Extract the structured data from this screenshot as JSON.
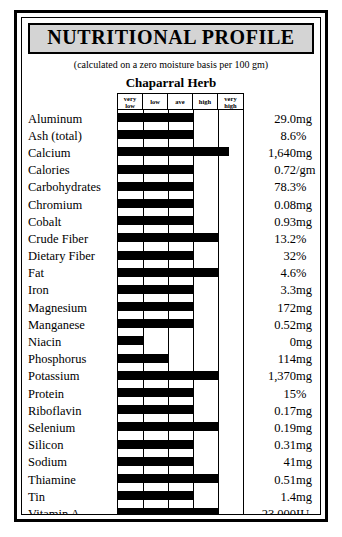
{
  "document": {
    "title": "NUTRITIONAL PROFILE",
    "subtitle": "(calculated on a zero moisture basis per 100 gm)",
    "product": "Chaparral Herb"
  },
  "scale": {
    "labels": [
      {
        "line1": "very",
        "line2": "low"
      },
      {
        "line1": "low",
        "line2": ""
      },
      {
        "line1": "ave",
        "line2": ""
      },
      {
        "line1": "high",
        "line2": ""
      },
      {
        "line1": "very",
        "line2": "high"
      }
    ]
  },
  "colors": {
    "bar": "#000000",
    "title_band": "#d4d4d4",
    "rule": "#000000",
    "page": "#ffffff"
  },
  "rows": [
    {
      "nutrient": "Aluminum",
      "value": "29.0",
      "unit": "mg",
      "bar_pct": 60
    },
    {
      "nutrient": "Ash (total)",
      "value": "8.6",
      "unit": "%",
      "bar_pct": 60
    },
    {
      "nutrient": "Calcium",
      "value": "1,640",
      "unit": "mg",
      "bar_pct": 89
    },
    {
      "nutrient": "Calories",
      "value": "0.72",
      "unit": "/gm",
      "bar_pct": 60
    },
    {
      "nutrient": "Carbohydrates",
      "value": "78.3",
      "unit": "%",
      "bar_pct": 60
    },
    {
      "nutrient": "Chromium",
      "value": "0.08",
      "unit": "mg",
      "bar_pct": 60
    },
    {
      "nutrient": "Cobalt",
      "value": "0.93",
      "unit": "mg",
      "bar_pct": 60
    },
    {
      "nutrient": "Crude Fiber",
      "value": "13.2",
      "unit": "%",
      "bar_pct": 80
    },
    {
      "nutrient": "Dietary Fiber",
      "value": "32",
      "unit": "%",
      "bar_pct": 60
    },
    {
      "nutrient": "Fat",
      "value": "4.6",
      "unit": "%",
      "bar_pct": 80
    },
    {
      "nutrient": "Iron",
      "value": "3.3",
      "unit": "mg",
      "bar_pct": 60
    },
    {
      "nutrient": "Magnesium",
      "value": "172",
      "unit": "mg",
      "bar_pct": 60
    },
    {
      "nutrient": "Manganese",
      "value": "0.52",
      "unit": "mg",
      "bar_pct": 60
    },
    {
      "nutrient": "Niacin",
      "value": "0",
      "unit": "mg",
      "bar_pct": 20
    },
    {
      "nutrient": "Phosphorus",
      "value": "114",
      "unit": "mg",
      "bar_pct": 40
    },
    {
      "nutrient": "Potassium",
      "value": "1,370",
      "unit": "mg",
      "bar_pct": 80
    },
    {
      "nutrient": "Protein",
      "value": "15",
      "unit": "%",
      "bar_pct": 60
    },
    {
      "nutrient": "Riboflavin",
      "value": "0.17",
      "unit": "mg",
      "bar_pct": 60
    },
    {
      "nutrient": "Selenium",
      "value": "0.19",
      "unit": "mg",
      "bar_pct": 80
    },
    {
      "nutrient": "Silicon",
      "value": "0.31",
      "unit": "mg",
      "bar_pct": 60
    },
    {
      "nutrient": "Sodium",
      "value": "41",
      "unit": "mg",
      "bar_pct": 60
    },
    {
      "nutrient": "Thiamine",
      "value": "0.51",
      "unit": "mg",
      "bar_pct": 80
    },
    {
      "nutrient": "Tin",
      "value": "1.4",
      "unit": "mg",
      "bar_pct": 60
    },
    {
      "nutrient": "Vitamin A",
      "value": "23,000",
      "unit": "IU",
      "bar_pct": 80
    },
    {
      "nutrient": "Vitamin C",
      "value": "76",
      "unit": "mg",
      "bar_pct": 80
    },
    {
      "nutrient": "Zinc",
      "value": "trace",
      "unit": "mg",
      "bar_pct": 20
    }
  ],
  "chart_data": {
    "type": "bar",
    "title": "NUTRITIONAL PROFILE",
    "subtitle": "(calculated on a zero moisture basis per 100 gm)",
    "annotations": [
      "Chaparral Herb"
    ],
    "orientation": "horizontal",
    "xlabel": "",
    "ylabel": "",
    "grid": true,
    "legend_position": "none",
    "xtick_labels": [
      "very low",
      "low",
      "ave",
      "high",
      "very high"
    ],
    "xlim": [
      0,
      100
    ],
    "categories": [
      "Aluminum",
      "Ash (total)",
      "Calcium",
      "Calories",
      "Carbohydrates",
      "Chromium",
      "Cobalt",
      "Crude Fiber",
      "Dietary Fiber",
      "Fat",
      "Iron",
      "Magnesium",
      "Manganese",
      "Niacin",
      "Phosphorus",
      "Potassium",
      "Protein",
      "Riboflavin",
      "Selenium",
      "Silicon",
      "Sodium",
      "Thiamine",
      "Tin",
      "Vitamin A",
      "Vitamin C",
      "Zinc"
    ],
    "values": [
      60,
      60,
      89,
      60,
      60,
      60,
      60,
      80,
      60,
      80,
      60,
      60,
      60,
      20,
      40,
      80,
      60,
      60,
      80,
      60,
      60,
      80,
      60,
      80,
      80,
      20
    ],
    "data_labels": [
      "29.0 mg",
      "8.6 %",
      "1,640 mg",
      "0.72 /gm",
      "78.3 %",
      "0.08 mg",
      "0.93 mg",
      "13.2 %",
      "32 %",
      "4.6 %",
      "3.3 mg",
      "172 mg",
      "0.52 mg",
      "0 mg",
      "114 mg",
      "1,370 mg",
      "15 %",
      "0.17 mg",
      "0.19 mg",
      "0.31 mg",
      "41 mg",
      "0.51 mg",
      "1.4 mg",
      "23,000 IU",
      "76 mg",
      "trace mg"
    ]
  }
}
